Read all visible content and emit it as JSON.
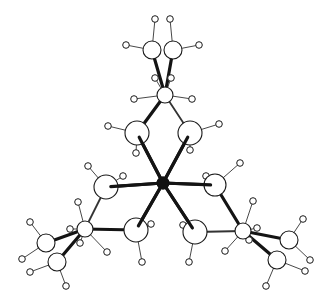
{
  "figure": {
    "title": "",
    "colors": {
      "metal": "#111111",
      "atom_fill": "#ffffff",
      "outline": "#1a1a1a"
    }
  },
  "atoms": [
    {
      "id": "M",
      "type": "metal"
    },
    {
      "id": "A1",
      "type": "heavy"
    },
    {
      "id": "A2",
      "type": "heavy"
    },
    {
      "id": "B1",
      "type": "heavy"
    },
    {
      "id": "B2",
      "type": "heavy"
    },
    {
      "id": "C1",
      "type": "heavy"
    },
    {
      "id": "C2",
      "type": "heavy"
    },
    {
      "id": "TA",
      "type": "heavy"
    },
    {
      "id": "TM1",
      "type": "heavy"
    },
    {
      "id": "TM2",
      "type": "heavy"
    },
    {
      "id": "LA",
      "type": "heavy"
    },
    {
      "id": "LM1",
      "type": "heavy"
    },
    {
      "id": "LM2",
      "type": "heavy"
    },
    {
      "id": "RA",
      "type": "heavy"
    },
    {
      "id": "RM1",
      "type": "heavy"
    },
    {
      "id": "RM2",
      "type": "heavy"
    }
  ],
  "bonds": [
    [
      "M",
      "A1"
    ],
    [
      "M",
      "A2"
    ],
    [
      "M",
      "B1"
    ],
    [
      "M",
      "B2"
    ],
    [
      "M",
      "C1"
    ],
    [
      "M",
      "C2"
    ],
    [
      "A1",
      "TA"
    ],
    [
      "A2",
      "TA"
    ],
    [
      "TA",
      "TM1"
    ],
    [
      "TA",
      "TM2"
    ],
    [
      "B1",
      "LA"
    ],
    [
      "B2",
      "LA"
    ],
    [
      "LA",
      "LM1"
    ],
    [
      "LA",
      "LM2"
    ],
    [
      "C1",
      "RA"
    ],
    [
      "C2",
      "RA"
    ],
    [
      "RA",
      "RM1"
    ],
    [
      "RA",
      "RM2"
    ]
  ]
}
